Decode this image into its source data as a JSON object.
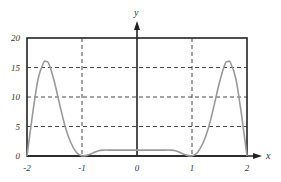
{
  "chart_data": {
    "type": "line",
    "title": "",
    "xlabel": "x",
    "ylabel": "y",
    "xlim": [
      -2,
      2
    ],
    "ylim": [
      0,
      20
    ],
    "grid": true,
    "x_ticks": [
      "-2",
      "-1",
      "0",
      "1",
      "2"
    ],
    "y_ticks": [
      "0",
      "5",
      "10",
      "15",
      "20"
    ],
    "series": [
      {
        "name": "f(x)",
        "color": "#999999",
        "x": [
          -2,
          -1.9,
          -1.8,
          -1.7,
          -1.65,
          -1.6,
          -1.5,
          -1.4,
          -1.3,
          -1.2,
          -1.1,
          -1.0,
          -0.9,
          -0.8,
          -0.7,
          -0.6,
          -0.5,
          0,
          0.5,
          0.6,
          0.7,
          0.8,
          0.9,
          1.0,
          1.1,
          1.2,
          1.3,
          1.4,
          1.5,
          1.6,
          1.65,
          1.7,
          1.8,
          1.9,
          2
        ],
        "y": [
          0,
          7,
          13,
          15.8,
          16,
          15.6,
          12.5,
          8.5,
          4.8,
          2.2,
          0.6,
          0,
          0.15,
          0.5,
          0.9,
          1.0,
          1.0,
          1.0,
          1.0,
          1.0,
          0.9,
          0.5,
          0.15,
          0,
          0.6,
          2.2,
          4.8,
          8.5,
          12.5,
          15.6,
          16,
          15.8,
          13,
          7,
          0
        ]
      }
    ]
  }
}
